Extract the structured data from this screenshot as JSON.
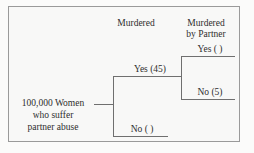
{
  "diagram": {
    "type": "decision-tree",
    "headers": {
      "col1": "Murdered",
      "col2_line1": "Murdered",
      "col2_line2": "by Partner"
    },
    "root": {
      "line1": "100,000 Women",
      "line2": "who suffer",
      "line3": "partner abuse",
      "count": "100,000"
    },
    "branches": {
      "murdered_yes": "Yes (45)",
      "murdered_no": "No (  )",
      "partner_yes": "Yes (  )",
      "partner_no": "No (5)"
    },
    "values": {
      "murdered_yes_count": "45",
      "murdered_no_count": "",
      "partner_yes_count": "",
      "partner_no_count": "5"
    },
    "colors": {
      "background": "#f8f8f7",
      "line": "#6f6f6f",
      "border": "#9a9a9a",
      "text": "#2e2e2e"
    }
  }
}
